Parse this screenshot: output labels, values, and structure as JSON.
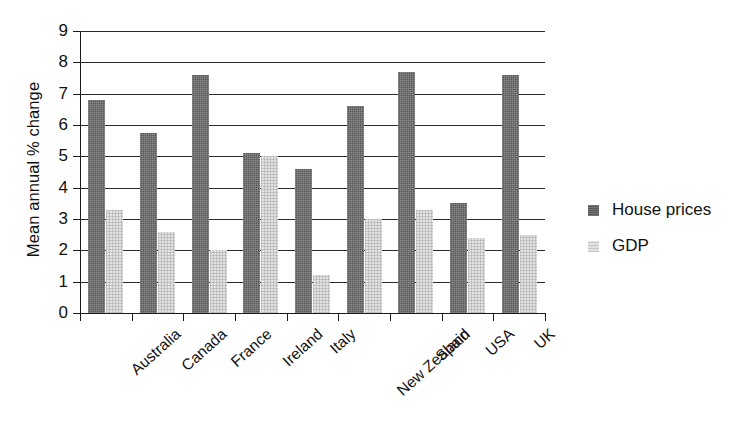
{
  "chart_data": {
    "type": "bar",
    "title": "",
    "subtitle": "",
    "xlabel": "",
    "ylabel": "Mean annual % change",
    "ylim": [
      0,
      9
    ],
    "ytick_labels": [
      "0",
      "1",
      "2",
      "3",
      "4",
      "5",
      "6",
      "7",
      "8",
      "9"
    ],
    "ytick_values": [
      0,
      1,
      2,
      3,
      4,
      5,
      6,
      7,
      8,
      9
    ],
    "grid": true,
    "legend_position": "right",
    "categories": [
      "Australia",
      "Canada",
      "France",
      "Ireland",
      "Italy",
      "New Zealand",
      "Spain",
      "USA",
      "UK"
    ],
    "series": [
      {
        "name": "House prices",
        "color": "#585858",
        "values": [
          6.8,
          5.75,
          7.6,
          5.1,
          4.6,
          6.6,
          7.7,
          3.5,
          7.6
        ]
      },
      {
        "name": "GDP",
        "color": "#e2e2e2",
        "values": [
          3.3,
          2.6,
          2.0,
          5.0,
          1.2,
          3.0,
          3.3,
          2.4,
          2.5
        ]
      }
    ]
  },
  "legend": {
    "items": [
      {
        "label": "House prices",
        "swatch": "house"
      },
      {
        "label": "GDP",
        "swatch": "gdp"
      }
    ]
  },
  "axes": {
    "y_title": "Mean annual % change"
  }
}
